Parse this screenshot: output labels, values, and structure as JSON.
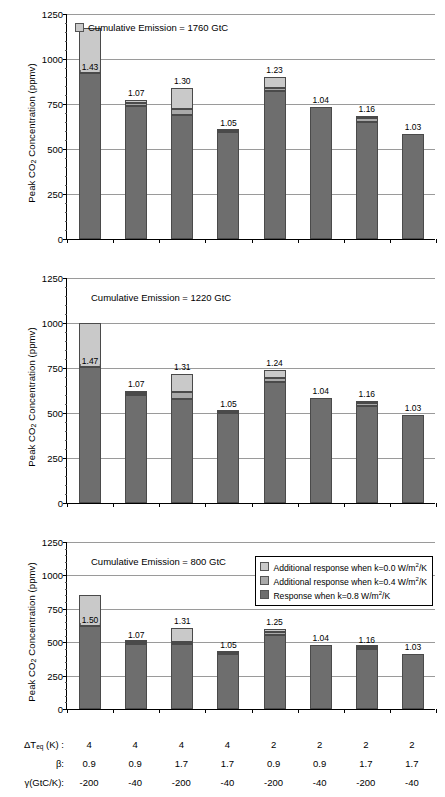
{
  "axis": {
    "y_title": "Peak CO2 Concentration (ppmv)",
    "y_title_pre": "Peak CO",
    "y_title_sub": "2",
    "y_title_post": " Concentration (ppmv)",
    "y_ticks": [
      "0",
      "250",
      "500",
      "750",
      "1000",
      "1250"
    ]
  },
  "legend": {
    "items": [
      {
        "swatch": "k0",
        "text_pre": "Additional response when k=0.0 W/m",
        "sup": "2",
        "text_post": "/K"
      },
      {
        "swatch": "k4",
        "text_pre": "Additional response when k=0.4 W/m",
        "sup": "2",
        "text_post": "/K"
      },
      {
        "swatch": "k8",
        "text_pre": "Response when k=0.8 W/m",
        "sup": "2",
        "text_post": "/K"
      }
    ]
  },
  "panels": [
    {
      "annotation": "Cumulative Emission = 1760 GtC",
      "has_swatch": true
    },
    {
      "annotation": "Cumulative Emission = 1220 GtC",
      "has_swatch": false
    },
    {
      "annotation": "Cumulative Emission = 800 GtC",
      "has_swatch": false
    }
  ],
  "param_rows": [
    {
      "label_pre": "ΔT",
      "label_sub": "eq",
      "label_post": " (K) :",
      "values": [
        "4",
        "4",
        "4",
        "4",
        "2",
        "2",
        "2",
        "2"
      ]
    },
    {
      "label_pre": "β:",
      "label_sub": "",
      "label_post": "",
      "values": [
        "0.9",
        "0.9",
        "1.7",
        "1.7",
        "0.9",
        "0.9",
        "1.7",
        "1.7"
      ]
    },
    {
      "label_pre": "γ(GtC/K):",
      "label_sub": "",
      "label_post": "",
      "values": [
        "-200",
        "-40",
        "-200",
        "-40",
        "-200",
        "-40",
        "-200",
        "-40"
      ]
    }
  ],
  "colors": {
    "k08": "#6e6e6e",
    "k04": "#a9a9a9",
    "k00": "#c9c9c9",
    "grid": "#9a9a9a",
    "axis": "#000000"
  },
  "chart_data": {
    "type": "bar",
    "layout": "three stacked-bar panels, shared categories and y-axis",
    "title": "",
    "xlabel": "",
    "ylabel": "Peak CO2 Concentration (ppmv)",
    "ylim": [
      0,
      1250
    ],
    "yticks": [
      0,
      250,
      500,
      750,
      1000,
      1250
    ],
    "grid": true,
    "legend_position": "inside bottom panel, upper right",
    "stack_order": [
      "Response when k=0.8 W/m2/K",
      "Additional response when k=0.4 W/m2/K",
      "Additional response when k=0.0 W/m2/K"
    ],
    "categories": [
      "1",
      "2",
      "3",
      "4",
      "5",
      "6",
      "7",
      "8"
    ],
    "category_params": {
      "dT_eq_K": [
        4,
        4,
        4,
        4,
        2,
        2,
        2,
        2
      ],
      "beta": [
        0.9,
        0.9,
        1.7,
        1.7,
        0.9,
        0.9,
        1.7,
        1.7
      ],
      "gamma_GtC_per_K": [
        -200,
        -40,
        -200,
        -40,
        -200,
        -40,
        -200,
        -40
      ]
    },
    "panels": [
      {
        "name": "Cumulative Emission = 1760 GtC",
        "cumulative_emission_GtC": 1760,
        "series": [
          {
            "name": "Response when k=0.8 W/m2/K",
            "values": [
              920,
              740,
              690,
              595,
              825,
              735,
              650,
              585
            ]
          },
          {
            "name": "Additional response when k=0.4 W/m2/K",
            "values": [
              15,
              15,
              30,
              5,
              15,
              0,
              20,
              0
            ]
          },
          {
            "name": "Additional response when k=0.0 W/m2/K",
            "values": [
              240,
              15,
              120,
              5,
              60,
              0,
              15,
              0
            ]
          }
        ],
        "totals": [
          1175,
          770,
          840,
          605,
          900,
          735,
          685,
          585
        ],
        "ratio_labels": [
          "1.43",
          "1.07",
          "1.30",
          "1.05",
          "1.23",
          "1.04",
          "1.16",
          "1.03"
        ]
      },
      {
        "name": "Cumulative Emission = 1220 GtC",
        "cumulative_emission_GtC": 1220,
        "series": [
          {
            "name": "Response when k=0.8 W/m2/K",
            "values": [
              755,
              600,
              580,
              500,
              670,
              585,
              540,
              490
            ]
          },
          {
            "name": "Additional response when k=0.4 W/m2/K",
            "values": [
              10,
              10,
              35,
              5,
              25,
              0,
              15,
              0
            ]
          },
          {
            "name": "Additional response when k=0.0 W/m2/K",
            "values": [
              235,
              15,
              100,
              5,
              45,
              0,
              10,
              0
            ]
          }
        ],
        "totals": [
          1000,
          625,
          715,
          510,
          740,
          585,
          565,
          490
        ],
        "ratio_labels": [
          "1.47",
          "1.07",
          "1.31",
          "1.05",
          "1.24",
          "1.04",
          "1.16",
          "1.03"
        ]
      },
      {
        "name": "Cumulative Emission = 800 GtC",
        "cumulative_emission_GtC": 800,
        "series": [
          {
            "name": "Response when k=0.8 W/m2/K",
            "values": [
              625,
              490,
              490,
              415,
              555,
              480,
              450,
              410
            ]
          },
          {
            "name": "Additional response when k=0.4 W/m2/K",
            "values": [
              10,
              10,
              15,
              5,
              20,
              0,
              12,
              0
            ]
          },
          {
            "name": "Additional response when k=0.0 W/m2/K",
            "values": [
              215,
              5,
              105,
              5,
              25,
              0,
              5,
              0
            ]
          }
        ],
        "totals": [
          850,
          505,
          610,
          425,
          600,
          480,
          467,
          410
        ],
        "ratio_labels": [
          "1.50",
          "1.07",
          "1.31",
          "1.05",
          "1.25",
          "1.04",
          "1.16",
          "1.03"
        ]
      }
    ]
  }
}
